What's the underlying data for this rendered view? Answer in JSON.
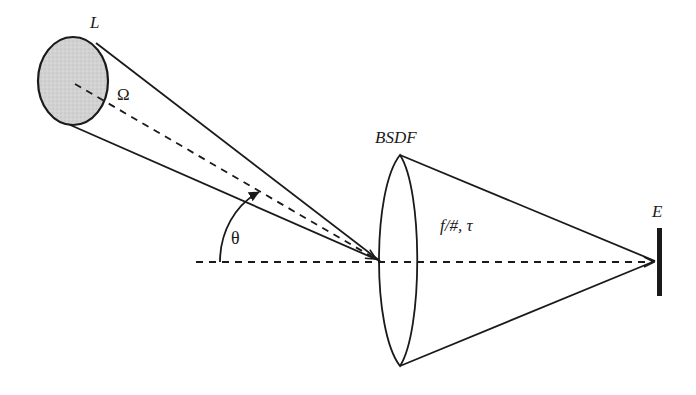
{
  "diagram": {
    "labels": {
      "source_radiance": "L",
      "solid_angle": "Ω",
      "angle": "θ",
      "optic": "BSDF",
      "optic_params": "f/#, τ",
      "detector": "E"
    },
    "colors": {
      "line": "#1a1a1a",
      "source_fill": "#cfcfcf",
      "background": "#ffffff"
    },
    "elements": [
      "source disk (L)",
      "collimated-ish beam cone subtending solid angle Ω",
      "dashed chief ray to optic",
      "angle θ between chief ray and optical axis",
      "optic / lens element (BSDF)",
      "converging cone to detector (f/#, τ)",
      "detector plane (E)"
    ]
  }
}
